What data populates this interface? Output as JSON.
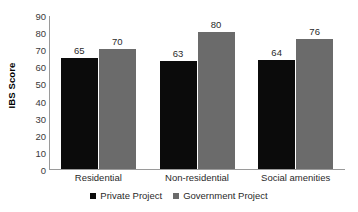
{
  "chart_data": {
    "type": "bar",
    "title": "",
    "subtitle": "",
    "xlabel": "",
    "ylabel": "IBS Score",
    "ylim": [
      0,
      90
    ],
    "ytick_step": 10,
    "yticks": [
      90,
      80,
      70,
      60,
      50,
      40,
      30,
      20,
      10,
      0
    ],
    "categories": [
      "Residential",
      "Non-residential",
      "Social amenities"
    ],
    "series": [
      {
        "name": "Private Project",
        "color": "#0b0b0b",
        "values": [
          65,
          63,
          64
        ]
      },
      {
        "name": "Government Project",
        "color": "#6b6b6b",
        "values": [
          70,
          80,
          76
        ]
      }
    ],
    "grid": false,
    "legend_position": "bottom-center",
    "data_labels": true,
    "axis_color": "#9a9a9a"
  },
  "legend": {
    "items": [
      {
        "label": "Private Project",
        "marker": "square-marker-black"
      },
      {
        "label": "Government Project",
        "marker": "square-marker-gray"
      }
    ]
  }
}
